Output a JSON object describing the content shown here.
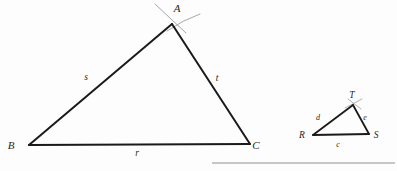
{
  "figure": {
    "background_color": "#fdfdfd",
    "stroke_color": "#1a1a1a",
    "construction_mark_color": "#a8a8a8",
    "rule_color": "#b5b5b5",
    "large_triangle": {
      "name": "triangle-abc",
      "vertices": [
        {
          "label": "A",
          "x": 172,
          "y": 24,
          "label_x": 177,
          "label_y": 12
        },
        {
          "label": "B",
          "x": 29,
          "y": 145,
          "label_x": 11,
          "label_y": 149
        },
        {
          "label": "C",
          "x": 250,
          "y": 144,
          "label_x": 256,
          "label_y": 149
        }
      ],
      "sides": [
        {
          "label": "s",
          "from": "B",
          "to": "A",
          "label_x": 86,
          "label_y": 80
        },
        {
          "label": "t",
          "from": "A",
          "to": "C",
          "label_x": 217,
          "label_y": 81
        },
        {
          "label": "r",
          "from": "B",
          "to": "C",
          "label_x": 137,
          "label_y": 156
        }
      ]
    },
    "small_triangle": {
      "name": "triangle-rst",
      "vertices": [
        {
          "label": "T",
          "x": 353,
          "y": 105,
          "label_x": 352,
          "label_y": 98
        },
        {
          "label": "R",
          "x": 313,
          "y": 135,
          "label_x": 302,
          "label_y": 138
        },
        {
          "label": "S",
          "x": 369,
          "y": 134,
          "label_x": 376,
          "label_y": 138
        }
      ],
      "sides": [
        {
          "label": "d",
          "from": "R",
          "to": "T",
          "label_x": 318,
          "label_y": 120
        },
        {
          "label": "e",
          "from": "T",
          "to": "S",
          "label_x": 365,
          "label_y": 120
        },
        {
          "label": "c",
          "from": "R",
          "to": "S",
          "label_x": 338,
          "label_y": 147
        }
      ]
    },
    "horizontal_rule": {
      "name": "bottom-rule",
      "x1": 212,
      "x2": 395,
      "y": 163
    }
  }
}
